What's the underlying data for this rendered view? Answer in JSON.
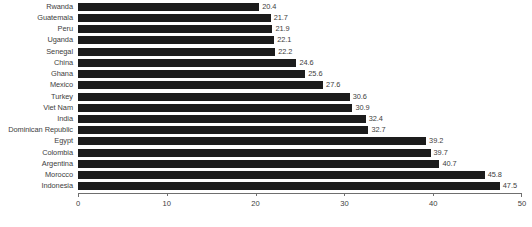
{
  "chart_data": {
    "type": "bar",
    "orientation": "horizontal",
    "title": "",
    "subtitle": "",
    "xlabel": "",
    "ylabel": "",
    "xlim": [
      0,
      50
    ],
    "grid": false,
    "legend": false,
    "bar_color": "#1c1c1c",
    "text_color": "#3d3d3d",
    "axis_color": "#6f6f6f",
    "background_color": "#ffffff",
    "value_label_format": "one-decimal",
    "xticks": [
      0,
      10,
      20,
      30,
      40,
      50
    ],
    "xtick_labels": [
      "0",
      "10",
      "20",
      "30",
      "40",
      "50"
    ],
    "categories": [
      "Rwanda",
      "Guatemala",
      "Peru",
      "Uganda",
      "Senegal",
      "China",
      "Ghana",
      "Mexico",
      "Turkey",
      "Viet Nam",
      "India",
      "Dominican Republic",
      "Egypt",
      "Colombia",
      "Argentina",
      "Morocco",
      "Indonesia"
    ],
    "values": [
      20.4,
      21.7,
      21.9,
      22.1,
      22.2,
      24.6,
      25.6,
      27.6,
      30.6,
      30.9,
      32.4,
      32.7,
      39.2,
      39.7,
      40.7,
      45.8,
      47.5
    ],
    "value_labels": [
      "20.4",
      "21.7",
      "21.9",
      "22.1",
      "22.2",
      "24.6",
      "25.6",
      "27.6",
      "30.6",
      "30.9",
      "32.4",
      "32.7",
      "39.2",
      "39.7",
      "40.7",
      "45.8",
      "47.5"
    ]
  }
}
